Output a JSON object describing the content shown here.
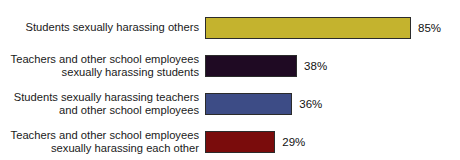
{
  "chart_data": {
    "type": "bar",
    "orientation": "horizontal",
    "title": "",
    "xlabel": "",
    "ylabel": "",
    "xlim": [
      0,
      100
    ],
    "grid": false,
    "legend": false,
    "value_suffix": "%",
    "categories": [
      "Students sexually harassing others",
      "Teachers and other school employees\nsexually harassing students",
      "Students sexually harassing teachers\nand other school employees",
      "Teachers and other school employees\nsexually harassing each other"
    ],
    "values": [
      85,
      38,
      36,
      29
    ],
    "value_labels": [
      "85%",
      "38%",
      "36%",
      "29%"
    ],
    "colors": [
      "#c4b32e",
      "#1f0a23",
      "#3d4c86",
      "#7a0c0c"
    ],
    "bar_outline_color": "#2b2b2b",
    "background_color": "#ffffff",
    "text_color": "#1a1a1a"
  }
}
